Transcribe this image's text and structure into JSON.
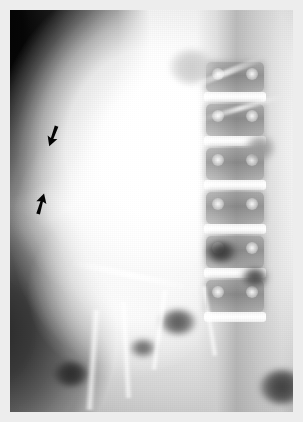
{
  "figure": {
    "modality": "plain-radiograph",
    "view": "abdominal-anteroposterior",
    "caption": "",
    "width": 303,
    "height": 422
  },
  "film": {
    "border_color": "#ededed",
    "border_width_px": 10,
    "background_color": "#cfcfcf",
    "grain": "visible"
  },
  "regions": [
    {
      "name": "soft-tissue-mass",
      "label": "large radio-opaque mass",
      "position": "left-upper-abdomen",
      "brightness": "very-high",
      "color": "#fdfdfd"
    },
    {
      "name": "flank-shadow",
      "label": "dark extra-abdominal background",
      "position": "upper-left",
      "brightness": "very-low",
      "color": "#050505"
    },
    {
      "name": "lumbar-spine",
      "label": "lumbar vertebral column",
      "position": "right",
      "brightness": "medium",
      "color": "#a8a8a8"
    },
    {
      "name": "bowel-gas",
      "label": "bowel gas shadows",
      "position": "lower-central-and-right",
      "brightness": "low",
      "color": "#4a4a4a"
    }
  ],
  "annotations": {
    "arrow_color": "#0a0a0a",
    "markers": [
      {
        "id": "arrow-upper",
        "name": "annotation-arrow-upper",
        "points_to": "superior-lateral-margin-of-mass",
        "direction": "down-right",
        "x": 44,
        "y": 124,
        "width": 18,
        "height": 24
      },
      {
        "id": "arrow-lower",
        "name": "annotation-arrow-lower",
        "points_to": "inferior-lateral-margin-of-mass",
        "direction": "up-right",
        "x": 32,
        "y": 192,
        "width": 18,
        "height": 24
      }
    ]
  },
  "vertebrae": [
    {
      "label": "",
      "top": 62,
      "height": 30
    },
    {
      "label": "",
      "top": 104,
      "height": 32
    },
    {
      "label": "",
      "top": 148,
      "height": 32
    },
    {
      "label": "",
      "top": 192,
      "height": 32
    },
    {
      "label": "",
      "top": 236,
      "height": 32
    },
    {
      "label": "",
      "top": 280,
      "height": 32
    }
  ],
  "gas_pockets": [
    {
      "left": 196,
      "top": 232,
      "w": 30,
      "h": 20,
      "shade": "#3a3a3a"
    },
    {
      "left": 232,
      "top": 258,
      "w": 26,
      "h": 18,
      "shade": "#4a4a4a"
    },
    {
      "left": 150,
      "top": 300,
      "w": 36,
      "h": 24,
      "shade": "#5a5a5a"
    },
    {
      "left": 120,
      "top": 330,
      "w": 26,
      "h": 16,
      "shade": "#6a6a6a"
    },
    {
      "left": 250,
      "top": 360,
      "w": 44,
      "h": 34,
      "shade": "#3f3f3f"
    },
    {
      "left": 44,
      "top": 352,
      "w": 34,
      "h": 24,
      "shade": "#2e2e2e"
    },
    {
      "left": 236,
      "top": 126,
      "w": 28,
      "h": 24,
      "shade": "#9a9a9a"
    },
    {
      "left": 160,
      "top": 40,
      "w": 44,
      "h": 34,
      "shade": "#cccccc"
    }
  ]
}
